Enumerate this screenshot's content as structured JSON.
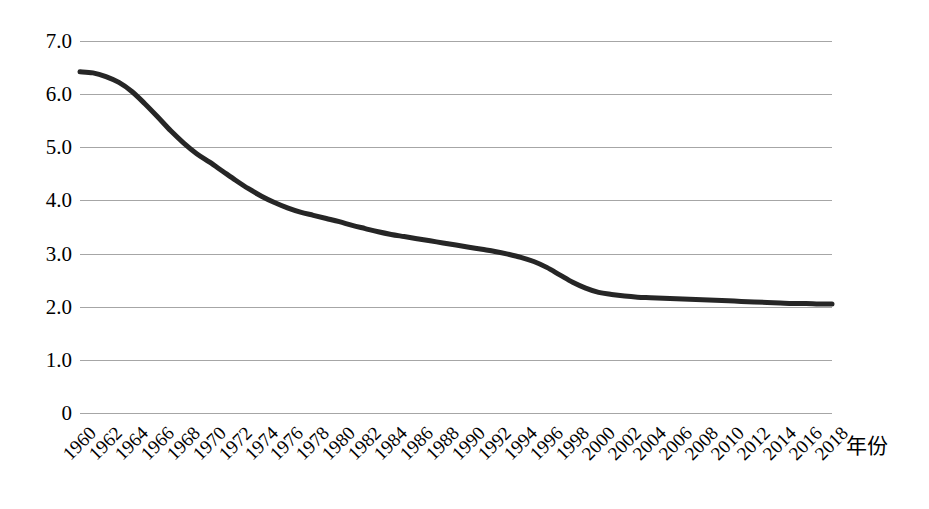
{
  "chart_data": {
    "type": "line",
    "title": "",
    "subtitle": "",
    "xlabel": "年份",
    "ylabel": "",
    "grid": true,
    "legend": false,
    "legend_position": "none",
    "line_color": "#262626",
    "grid_color": "#a6a6a6",
    "background_color": "#ffffff",
    "xlim": [
      1960,
      2018
    ],
    "ylim": [
      0,
      7
    ],
    "ytick_labels": [
      "7.0",
      "6.0",
      "5.0",
      "4.0",
      "3.0",
      "2.0",
      "1.0",
      "0"
    ],
    "ytick_values": [
      7,
      6,
      5,
      4,
      3,
      2,
      1,
      0
    ],
    "xtick_labels": [
      "1960",
      "1962",
      "1964",
      "1966",
      "1968",
      "1970",
      "1972",
      "1974",
      "1976",
      "1978",
      "1980",
      "1982",
      "1984",
      "1986",
      "1988",
      "1990",
      "1992",
      "1994",
      "1996",
      "1998",
      "2000",
      "2002",
      "2004",
      "2006",
      "2008",
      "2010",
      "2012",
      "2014",
      "2016",
      "2018"
    ],
    "xtick_values": [
      1960,
      1962,
      1964,
      1966,
      1968,
      1970,
      1972,
      1974,
      1976,
      1978,
      1980,
      1982,
      1984,
      1986,
      1988,
      1990,
      1992,
      1994,
      1996,
      1998,
      2000,
      2002,
      2004,
      2006,
      2008,
      2010,
      2012,
      2014,
      2016,
      2018
    ],
    "x": [
      1960,
      1961,
      1962,
      1963,
      1964,
      1965,
      1966,
      1967,
      1968,
      1969,
      1970,
      1971,
      1972,
      1973,
      1974,
      1975,
      1976,
      1977,
      1978,
      1979,
      1980,
      1981,
      1982,
      1983,
      1984,
      1985,
      1986,
      1987,
      1988,
      1989,
      1990,
      1991,
      1992,
      1993,
      1994,
      1995,
      1996,
      1997,
      1998,
      1999,
      2000,
      2001,
      2002,
      2003,
      2004,
      2005,
      2006,
      2007,
      2008,
      2009,
      2010,
      2011,
      2012,
      2013,
      2014,
      2015,
      2016,
      2017,
      2018
    ],
    "series": [
      {
        "name": "总和生育率",
        "values": [
          6.42,
          6.4,
          6.33,
          6.22,
          6.05,
          5.82,
          5.57,
          5.31,
          5.08,
          4.88,
          4.72,
          4.55,
          4.38,
          4.22,
          4.08,
          3.96,
          3.86,
          3.78,
          3.72,
          3.66,
          3.6,
          3.53,
          3.47,
          3.41,
          3.36,
          3.32,
          3.28,
          3.24,
          3.2,
          3.16,
          3.12,
          3.08,
          3.04,
          2.99,
          2.93,
          2.85,
          2.74,
          2.6,
          2.46,
          2.35,
          2.27,
          2.23,
          2.2,
          2.18,
          2.17,
          2.16,
          2.15,
          2.14,
          2.13,
          2.12,
          2.11,
          2.1,
          2.09,
          2.08,
          2.07,
          2.06,
          2.06,
          2.05,
          2.05
        ]
      }
    ]
  }
}
